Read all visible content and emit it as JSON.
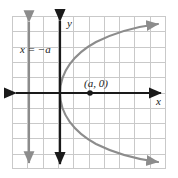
{
  "figure": {
    "kind": "coordinate-plane-graph",
    "background_color": "#ffffff"
  },
  "grid": {
    "color": "#c9c9c9",
    "x_start": 12,
    "y_start": 16,
    "cell_size": 15.3,
    "columns": 10,
    "rows": 10
  },
  "axes": {
    "color": "#1a1a1a",
    "x_axis": {
      "label": "x",
      "y_pixel": 93,
      "arrows": "both"
    },
    "y_axis": {
      "label": "y",
      "x_pixel": 60,
      "arrows": "both"
    }
  },
  "directrix": {
    "label": "x = −a",
    "color": "#8c8c8c",
    "x_pixel": 29,
    "arrows": "both"
  },
  "curve": {
    "name": "parabola",
    "color": "#8c8c8c",
    "opens": "right",
    "vertex_pixel": [
      60,
      93
    ],
    "arrows": "both-ends",
    "upper_branch_path": "M 60 93 C 60 72, 74 54, 96 42 C 118 31, 142 26, 160 24",
    "lower_branch_path": "M 60 93 C 60 114, 74 132, 96 144 C 118 155, 142 160, 160 162"
  },
  "point": {
    "label": "(a, 0)",
    "color": "#1a1a1a",
    "x_pixel": 90,
    "y_pixel": 93,
    "radius": 2.6
  }
}
